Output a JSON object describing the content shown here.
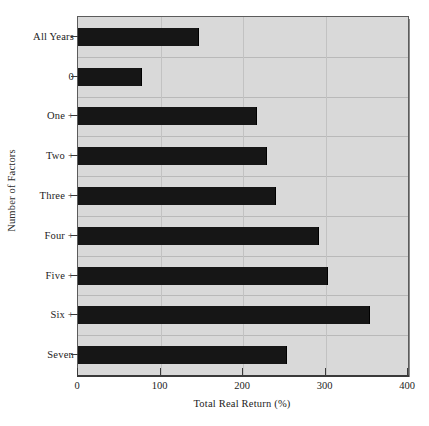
{
  "chart_data": {
    "type": "bar",
    "orientation": "horizontal",
    "title": "",
    "subtitle": "",
    "xlabel": "Total Real Return (%)",
    "ylabel": "Number of Factors",
    "categories": [
      "All Years",
      "0",
      "One +",
      "Two +",
      "Three +",
      "Four +",
      "Five +",
      "Six +",
      "Seven"
    ],
    "values": [
      147,
      78,
      217,
      229,
      240,
      292,
      303,
      354,
      253
    ],
    "xlim": [
      0,
      400
    ],
    "xticks": [
      0,
      100,
      200,
      300,
      400
    ],
    "xtick_labels": [
      "0",
      "100",
      "200",
      "300",
      "400"
    ],
    "grid": true,
    "grid_axis": "both",
    "legend": null,
    "legend_position": "none",
    "annotations": [],
    "series": [
      {
        "name": "Total Real Return",
        "values": [
          147,
          78,
          217,
          229,
          240,
          292,
          303,
          354,
          253
        ]
      }
    ]
  },
  "style": {
    "plot_background": "#d9d9d9",
    "bar_color": "#161616",
    "gridline_color": "#b9b9b9",
    "axis_color": "#3a3a3a",
    "text_color": "#1c1c1c",
    "figure_background": "#ffffff"
  }
}
